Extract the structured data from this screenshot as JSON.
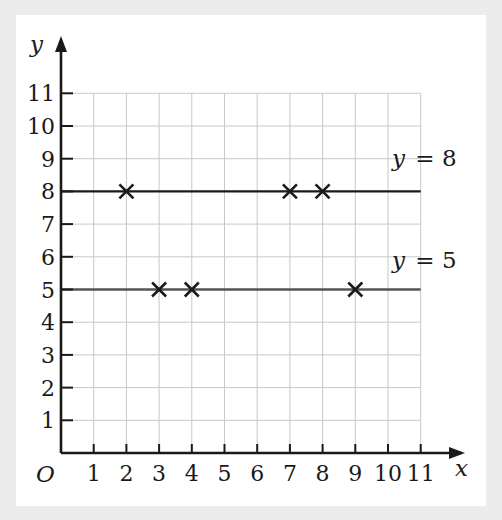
{
  "chart_data": {
    "type": "scatter",
    "title": "",
    "xlabel": "x",
    "ylabel": "y",
    "origin_label": "O",
    "xlim": [
      0,
      11
    ],
    "ylim": [
      0,
      11
    ],
    "x_ticks": [
      1,
      2,
      3,
      4,
      5,
      6,
      7,
      8,
      9,
      10,
      11
    ],
    "y_ticks": [
      1,
      2,
      3,
      4,
      5,
      6,
      7,
      8,
      9,
      10,
      11
    ],
    "grid": true,
    "lines": [
      {
        "name": "y = 8",
        "type": "horizontal",
        "y": 8,
        "x_range": [
          0,
          11
        ],
        "label": "y = 8",
        "color": "#1a1a1a"
      },
      {
        "name": "y = 5",
        "type": "horizontal",
        "y": 5,
        "x_range": [
          0,
          11
        ],
        "label": "y = 5",
        "color": "#555555"
      }
    ],
    "series": [
      {
        "name": "points",
        "marker": "x",
        "points": [
          [
            2,
            8
          ],
          [
            7,
            8
          ],
          [
            8,
            8
          ],
          [
            3,
            5
          ],
          [
            4,
            5
          ],
          [
            9,
            5
          ]
        ]
      }
    ]
  },
  "labels": {
    "y_axis": "y",
    "x_axis": "x",
    "origin": "O",
    "line8_var": "y",
    "line8_rest": " = 8",
    "line5_var": "y",
    "line5_rest": " = 5"
  },
  "colors": {
    "background": "#ececec",
    "panel": "#ffffff",
    "grid": "#c8c8c8",
    "axis": "#1a1a1a"
  }
}
